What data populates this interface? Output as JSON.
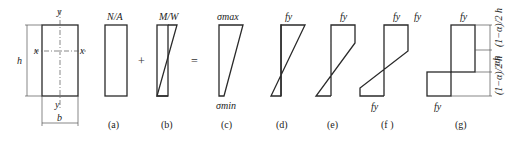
{
  "section": {
    "width_label": "b",
    "height_label": "h",
    "axis_x": "x",
    "axis_y": "y",
    "axis_y_bottom": "y"
  },
  "operators": {
    "plus": "+",
    "equals": "="
  },
  "diagrams": [
    {
      "id": "a",
      "top_label": "N/A",
      "caption": "(a)"
    },
    {
      "id": "b",
      "top_label": "M/W",
      "caption": "(b)"
    },
    {
      "id": "c",
      "top_label": "σmax",
      "bottom_label": "σmin",
      "caption": "(c)"
    },
    {
      "id": "d",
      "top_label": "fy",
      "caption": "(d)"
    },
    {
      "id": "e",
      "top_label": "fy",
      "caption": "(e)"
    },
    {
      "id": "f",
      "top_label": "fy",
      "top_right_label": "fy",
      "bottom_label": "fy",
      "caption": "(f )"
    },
    {
      "id": "g",
      "top_label": "fy",
      "bottom_label": "fy",
      "caption": "(g)",
      "dims": {
        "top": "(1−α)/2 h",
        "middle": "αh",
        "bottom": "(1−α)/2 h"
      }
    }
  ]
}
